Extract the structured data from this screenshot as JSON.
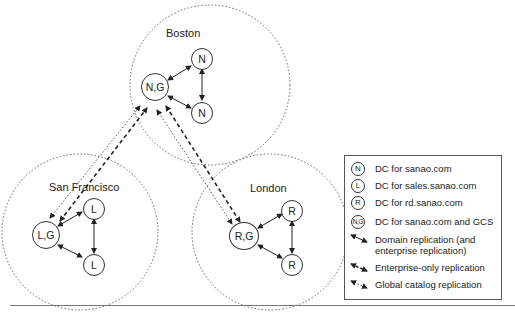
{
  "sites": [
    {
      "name": "Boston",
      "nodes": [
        "N,G",
        "N",
        "N"
      ]
    },
    {
      "name": "San Francisco",
      "nodes": [
        "L,G",
        "L",
        "L"
      ]
    },
    {
      "name": "London",
      "nodes": [
        "R,G",
        "R",
        "R"
      ]
    }
  ],
  "legend": {
    "items": [
      {
        "symbol": "N",
        "label": "DC for sanao.com"
      },
      {
        "symbol": "L",
        "label": "DC for sales.sanao.com"
      },
      {
        "symbol": "R",
        "label": "DC for rd.sanao.com"
      },
      {
        "symbol": "N,G",
        "label": "DC for sanao.com and GCS"
      },
      {
        "symbol": "solid-arrow",
        "label": "Domain replication (and enterprise replication)"
      },
      {
        "symbol": "dashed-arrow",
        "label": "Enterprise-only replication"
      },
      {
        "symbol": "dotted-arrow",
        "label": "Global catalog replication"
      }
    ]
  },
  "colors": {
    "line": "#333333",
    "site_border": "#666666",
    "background": "#ffffff"
  }
}
